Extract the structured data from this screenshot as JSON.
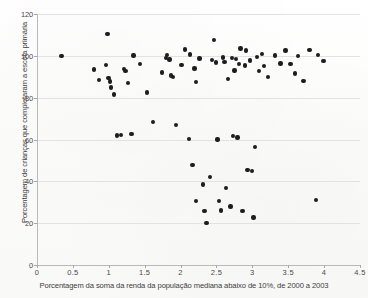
{
  "chart_data": {
    "type": "scatter",
    "title": "",
    "xlabel": "Porcentagem da soma da renda da população mediana abaixo de 10%, de 2000 a 2003",
    "ylabel": "Porcentagem de crianças que completaram a escola primária",
    "xlim": [
      0,
      4.5
    ],
    "ylim": [
      0,
      120
    ],
    "xticks": [
      0,
      0.5,
      1,
      1.5,
      2,
      2.5,
      3,
      3.5,
      4,
      4.5
    ],
    "xtick_labels": [
      "0",
      "0.5",
      "1",
      "1.5",
      "2",
      "2.5",
      "3",
      "3.5",
      "4",
      "4.5"
    ],
    "yticks": [
      0,
      20,
      40,
      60,
      80,
      100,
      120
    ],
    "ytick_labels": [
      "0",
      "20",
      "40",
      "60",
      "80",
      "100",
      "120"
    ],
    "grid": "horizontal",
    "legend": "none",
    "marker_color": "#1d1d1d",
    "points": [
      {
        "x": 0.33,
        "y": 100.0
      },
      {
        "x": 0.78,
        "y": 93.4
      },
      {
        "x": 0.85,
        "y": 88.4
      },
      {
        "x": 0.95,
        "y": 95.7
      },
      {
        "x": 0.97,
        "y": 110.5
      },
      {
        "x": 0.98,
        "y": 89.4
      },
      {
        "x": 1.0,
        "y": 87.8
      },
      {
        "x": 1.02,
        "y": 84.8
      },
      {
        "x": 1.06,
        "y": 81.5
      },
      {
        "x": 1.1,
        "y": 62.0
      },
      {
        "x": 1.16,
        "y": 62.2
      },
      {
        "x": 1.2,
        "y": 93.6
      },
      {
        "x": 1.22,
        "y": 92.7
      },
      {
        "x": 1.25,
        "y": 87.0
      },
      {
        "x": 1.3,
        "y": 62.5
      },
      {
        "x": 1.33,
        "y": 100.2
      },
      {
        "x": 1.42,
        "y": 96.0
      },
      {
        "x": 1.52,
        "y": 82.5
      },
      {
        "x": 1.6,
        "y": 68.5
      },
      {
        "x": 1.73,
        "y": 92.0
      },
      {
        "x": 1.78,
        "y": 99.0
      },
      {
        "x": 1.8,
        "y": 100.5
      },
      {
        "x": 1.83,
        "y": 98.3
      },
      {
        "x": 1.85,
        "y": 90.6
      },
      {
        "x": 1.88,
        "y": 89.8
      },
      {
        "x": 1.92,
        "y": 66.8
      },
      {
        "x": 2.0,
        "y": 95.5
      },
      {
        "x": 2.05,
        "y": 103.0
      },
      {
        "x": 2.1,
        "y": 60.2
      },
      {
        "x": 2.12,
        "y": 100.6
      },
      {
        "x": 2.15,
        "y": 47.8
      },
      {
        "x": 2.18,
        "y": 94.0
      },
      {
        "x": 2.2,
        "y": 87.5
      },
      {
        "x": 2.2,
        "y": 30.5
      },
      {
        "x": 2.25,
        "y": 98.8
      },
      {
        "x": 2.3,
        "y": 38.5
      },
      {
        "x": 2.32,
        "y": 25.8
      },
      {
        "x": 2.35,
        "y": 20.0
      },
      {
        "x": 2.4,
        "y": 42.2
      },
      {
        "x": 2.42,
        "y": 98.0
      },
      {
        "x": 2.45,
        "y": 107.5
      },
      {
        "x": 2.48,
        "y": 96.8
      },
      {
        "x": 2.5,
        "y": 60.0
      },
      {
        "x": 2.52,
        "y": 30.6
      },
      {
        "x": 2.55,
        "y": 26.0
      },
      {
        "x": 2.58,
        "y": 99.2
      },
      {
        "x": 2.6,
        "y": 97.2
      },
      {
        "x": 2.62,
        "y": 36.8
      },
      {
        "x": 2.65,
        "y": 89.0
      },
      {
        "x": 2.68,
        "y": 28.0
      },
      {
        "x": 2.7,
        "y": 99.0
      },
      {
        "x": 2.72,
        "y": 61.8
      },
      {
        "x": 2.74,
        "y": 93.0
      },
      {
        "x": 2.76,
        "y": 98.5
      },
      {
        "x": 2.78,
        "y": 61.0
      },
      {
        "x": 2.8,
        "y": 96.0
      },
      {
        "x": 2.82,
        "y": 103.5
      },
      {
        "x": 2.85,
        "y": 25.8
      },
      {
        "x": 2.88,
        "y": 95.4
      },
      {
        "x": 2.9,
        "y": 102.5
      },
      {
        "x": 2.92,
        "y": 45.5
      },
      {
        "x": 2.95,
        "y": 97.8
      },
      {
        "x": 2.98,
        "y": 45.0
      },
      {
        "x": 3.0,
        "y": 22.8
      },
      {
        "x": 3.02,
        "y": 56.5
      },
      {
        "x": 3.05,
        "y": 99.5
      },
      {
        "x": 3.08,
        "y": 92.8
      },
      {
        "x": 3.12,
        "y": 100.8
      },
      {
        "x": 3.15,
        "y": 95.2
      },
      {
        "x": 3.2,
        "y": 89.8
      },
      {
        "x": 3.3,
        "y": 100.2
      },
      {
        "x": 3.38,
        "y": 96.4
      },
      {
        "x": 3.45,
        "y": 102.5
      },
      {
        "x": 3.52,
        "y": 96.0
      },
      {
        "x": 3.58,
        "y": 91.5
      },
      {
        "x": 3.62,
        "y": 100.0
      },
      {
        "x": 3.7,
        "y": 88.0
      },
      {
        "x": 3.78,
        "y": 102.8
      },
      {
        "x": 3.87,
        "y": 31.2
      },
      {
        "x": 3.9,
        "y": 100.5
      },
      {
        "x": 3.98,
        "y": 97.5
      }
    ]
  }
}
